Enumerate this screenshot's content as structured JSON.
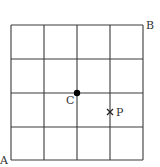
{
  "diagram": {
    "type": "grid",
    "rows": 4,
    "cols": 4,
    "line_color": "#3a3a3a",
    "bounds": {
      "left": 11,
      "top": 25,
      "right": 143,
      "bottom": 160
    },
    "vertical_lines_x": [
      11,
      44,
      77,
      110,
      143
    ],
    "horizontal_lines_y": [
      25,
      59,
      93,
      127,
      160
    ],
    "points": [
      {
        "id": "A",
        "label": "A",
        "marker": "none",
        "x": 11,
        "y": 160,
        "label_x": 0,
        "label_y": 164
      },
      {
        "id": "B",
        "label": "B",
        "marker": "none",
        "x": 143,
        "y": 25,
        "label_x": 146,
        "label_y": 29
      },
      {
        "id": "C",
        "label": "C",
        "marker": "filled-dot",
        "x": 77,
        "y": 93,
        "label_x": 66,
        "label_y": 104
      },
      {
        "id": "P",
        "label": "P",
        "marker": "cross",
        "x": 110,
        "y": 112,
        "label_x": 116,
        "label_y": 116
      }
    ]
  }
}
